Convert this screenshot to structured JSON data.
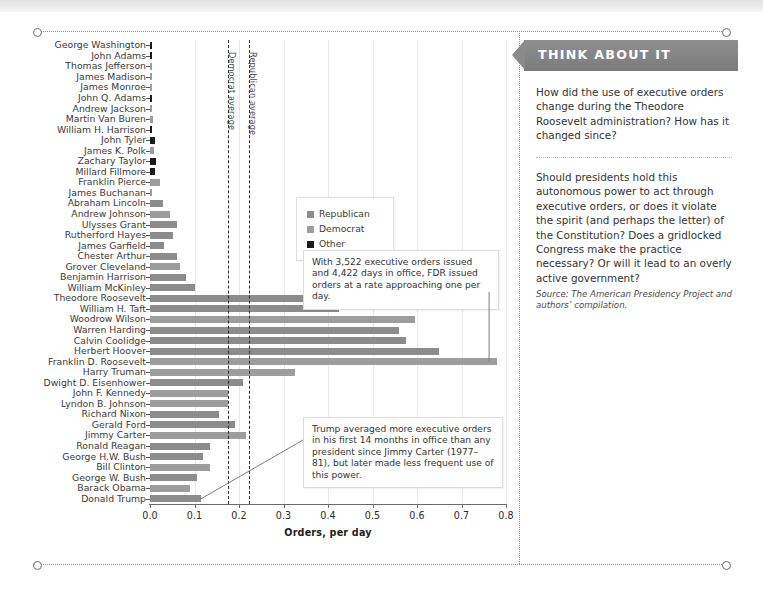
{
  "chart_data": {
    "type": "bar",
    "orientation": "horizontal",
    "title": "",
    "xlabel": "Orders, per day",
    "ylabel": "",
    "xlim": [
      0.0,
      0.8
    ],
    "xticks": [
      0.0,
      0.1,
      0.2,
      0.3,
      0.4,
      0.5,
      0.6,
      0.7,
      0.8
    ],
    "xticklabels": [
      "0.0",
      "0.1",
      "0.2",
      "0.3",
      "0.4",
      "0.5",
      "0.6",
      "0.7",
      "0.8"
    ],
    "grid": true,
    "legend_position": "upper-center",
    "legend": [
      {
        "label": "Republican",
        "color": "#8c8c8c"
      },
      {
        "label": "Democrat",
        "color": "#9d9d9d"
      },
      {
        "label": "Other",
        "color": "#1a1a1a"
      }
    ],
    "categories": [
      "George Washington",
      "John Adams",
      "Thomas Jefferson",
      "James Madison",
      "James Monroe",
      "John Q. Adams",
      "Andrew Jackson",
      "Martin Van Buren",
      "William H. Harrison",
      "John Tyler",
      "James K. Polk",
      "Zachary Taylor",
      "Millard Fillmore",
      "Franklin Pierce",
      "James Buchanan",
      "Abraham Lincoln",
      "Andrew Johnson",
      "Ulysses Grant",
      "Rutherford Hayes",
      "James Garfield",
      "Chester Arthur",
      "Grover Cleveland",
      "Benjamin Harrison",
      "William McKinley",
      "Theodore Roosevelt",
      "William H. Taft",
      "Woodrow Wilson",
      "Warren Harding",
      "Calvin Coolidge",
      "Herbert Hoover",
      "Franklin D. Roosevelt",
      "Harry Truman",
      "Dwight D. Eisenhower",
      "John F. Kennedy",
      "Lyndon B. Johnson",
      "Richard Nixon",
      "Gerald Ford",
      "Jimmy Carter",
      "Ronald Reagan",
      "George H.W. Bush",
      "Bill Clinton",
      "George W. Bush",
      "Barack Obama",
      "Donald Trump"
    ],
    "values": [
      0.005,
      0.004,
      0.002,
      0.001,
      0.001,
      0.004,
      0.004,
      0.006,
      0.003,
      0.012,
      0.01,
      0.013,
      0.012,
      0.022,
      0.005,
      0.03,
      0.046,
      0.06,
      0.051,
      0.031,
      0.06,
      0.068,
      0.081,
      0.102,
      0.395,
      0.425,
      0.595,
      0.56,
      0.575,
      0.65,
      0.78,
      0.325,
      0.21,
      0.175,
      0.175,
      0.155,
      0.19,
      0.215,
      0.135,
      0.12,
      0.135,
      0.105,
      0.09,
      0.115
    ],
    "parties": [
      "Other",
      "Other",
      "Democrat",
      "Democrat",
      "Democrat",
      "Other",
      "Democrat",
      "Democrat",
      "Other",
      "Other",
      "Democrat",
      "Other",
      "Other",
      "Democrat",
      "Democrat",
      "Republican",
      "Democrat",
      "Republican",
      "Republican",
      "Republican",
      "Republican",
      "Democrat",
      "Republican",
      "Republican",
      "Republican",
      "Republican",
      "Democrat",
      "Republican",
      "Republican",
      "Republican",
      "Democrat",
      "Democrat",
      "Republican",
      "Democrat",
      "Democrat",
      "Republican",
      "Republican",
      "Democrat",
      "Republican",
      "Republican",
      "Democrat",
      "Republican",
      "Democrat",
      "Republican"
    ],
    "reference_lines": [
      {
        "label": "Democrat average",
        "value": 0.175
      },
      {
        "label": "Republican average",
        "value": 0.222
      }
    ],
    "annotations": [
      {
        "name": "fdr-annotation",
        "text": "With 3,522 executive orders issued and 4,422 days in office, FDR issued orders at a rate approaching one per day.",
        "target": "Franklin D. Roosevelt"
      },
      {
        "name": "trump-annotation",
        "text": "Trump averaged more executive orders in his first 14 months in office than any president since Jimmy Carter (1977–81), but later made less frequent use of this power.",
        "target": "Donald Trump"
      }
    ]
  },
  "sidebar": {
    "tab_title": "THINK ABOUT IT",
    "paragraph_1": "How did the use of executive orders change during the Theodore Roosevelt administration? How has it changed since?",
    "paragraph_2": "Should presidents hold this autonomous power to act through executive orders, or does it violate the spirit (and perhaps the letter) of the Constitution? Does a gridlocked Congress make the practice necessary? Or will it lead to an overly active government?",
    "source": "Source: The American Presidency Project and authors’ compilation."
  }
}
